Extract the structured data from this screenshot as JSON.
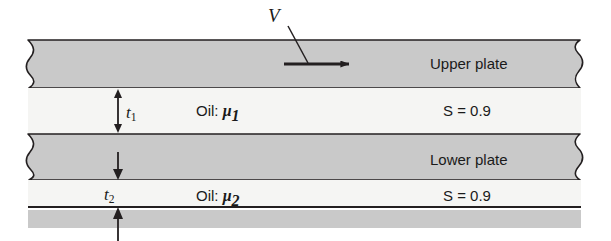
{
  "figure": {
    "width": 611,
    "height": 241
  },
  "colors": {
    "plate_fill": "#c9c9c9",
    "oil_fill": "#f5f5f3",
    "base_fill": "#c9c9c9",
    "stroke": "#231f20",
    "background": "#ffffff"
  },
  "labels": {
    "velocity": "V",
    "upper_plate": "Upper plate",
    "lower_plate": "Lower plate",
    "oil_top_prefix": "Oil: ",
    "oil_top_symbol": "μ",
    "oil_top_subscript": "1",
    "oil_bottom_prefix": "Oil: ",
    "oil_bottom_symbol": "μ",
    "oil_bottom_subscript": "2",
    "specific_gravity_top": "S = 0.9",
    "specific_gravity_bottom": "S = 0.9",
    "thickness_top_symbol": "t",
    "thickness_top_subscript": "1",
    "thickness_bottom_symbol": "t",
    "thickness_bottom_subscript": "2"
  },
  "bands": [
    {
      "name": "upper-plate",
      "kind": "plate",
      "y_top": 39,
      "y_bottom": 88,
      "label": "Upper plate"
    },
    {
      "name": "oil-layer-1",
      "kind": "oil",
      "y_top": 88,
      "y_bottom": 134,
      "label": "Oil: μ1",
      "specific_gravity": "S = 0.9"
    },
    {
      "name": "lower-plate",
      "kind": "plate",
      "y_top": 134,
      "y_bottom": 180,
      "label": "Lower plate"
    },
    {
      "name": "oil-layer-2",
      "kind": "oil",
      "y_top": 180,
      "y_bottom": 207,
      "label": "Oil: μ2",
      "specific_gravity": "S = 0.9"
    },
    {
      "name": "base-surface",
      "kind": "base",
      "y_top": 210,
      "y_bottom": 228,
      "label": ""
    }
  ],
  "annotations": {
    "velocity_arrow": {
      "name": "velocity-arrow",
      "x_start": 284,
      "x_end": 356,
      "y": 64,
      "direction": "right"
    },
    "velocity_leader": {
      "x_start": 288,
      "y_start": 26,
      "x_end": 308,
      "y_end": 63
    },
    "thickness_1_dimension": {
      "name": "t1-dimension-arrow",
      "x": 118,
      "y_top": 89,
      "y_bottom": 133,
      "style": "double-headed"
    },
    "thickness_2_dimension": {
      "name": "t2-dimension-arrow",
      "x": 118,
      "y_top": 152,
      "y_bottom": 241,
      "style": "two-inward-arrows"
    }
  }
}
